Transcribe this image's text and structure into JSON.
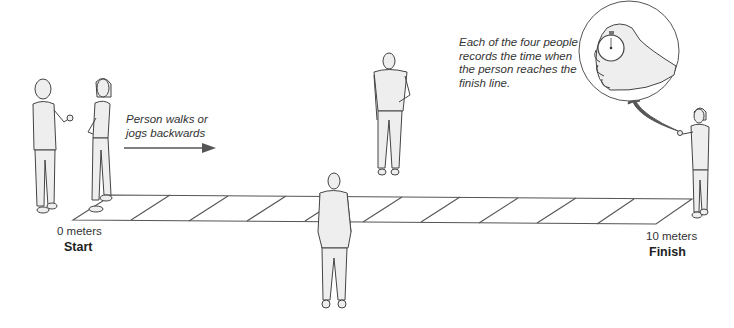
{
  "diagram": {
    "annotations": {
      "walk_direction": [
        "Person walks or",
        "jogs backwards"
      ],
      "timers_note": [
        "Each of the four people",
        "records the time when",
        "the person reaches the",
        "finish line."
      ]
    },
    "track": {
      "start_distance": "0 meters",
      "start_label": "Start",
      "finish_distance": "10 meters",
      "finish_label": "Finish",
      "segments": 10
    },
    "figures": [
      {
        "role": "timer-at-start",
        "icon": "standing-man-icon"
      },
      {
        "role": "subject-walker",
        "icon": "standing-woman-icon"
      },
      {
        "role": "timer-far-side",
        "icon": "standing-man-icon"
      },
      {
        "role": "timer-near-side",
        "icon": "standing-man-back-icon"
      },
      {
        "role": "timer-at-finish",
        "icon": "standing-woman-icon"
      }
    ],
    "inset": {
      "icon": "stopwatch-in-hand-icon"
    },
    "colors": {
      "line": "#555555",
      "arrow": "#555555",
      "figure_fill": "#eeeeee",
      "figure_stroke": "#444444"
    }
  }
}
